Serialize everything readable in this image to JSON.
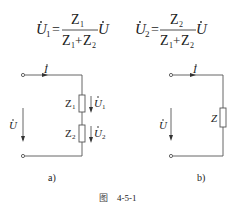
{
  "formulas": {
    "u1": {
      "lhs": "U",
      "lhs_sub": "1",
      "num": "Z",
      "num_sub": "1",
      "den_a": "Z",
      "den_a_sub": "1",
      "plus": "+",
      "den_b": "Z",
      "den_b_sub": "2",
      "rhs": "U",
      "eq": "="
    },
    "u2": {
      "lhs": "U",
      "lhs_sub": "2",
      "num": "Z",
      "num_sub": "2",
      "den_a": "Z",
      "den_a_sub": "1",
      "plus": "+",
      "den_b": "Z",
      "den_b_sub": "2",
      "rhs": "U",
      "eq": "="
    }
  },
  "circuit_a": {
    "current_label": "I",
    "voltage_label": "U",
    "z1_label": "Z",
    "z1_sub": "1",
    "z2_label": "Z",
    "z2_sub": "2",
    "u1_label": "U",
    "u1_sub": "1",
    "u2_label": "U",
    "u2_sub": "2",
    "caption": "a)"
  },
  "circuit_b": {
    "current_label": "I",
    "voltage_label": "U",
    "z_label": "Z",
    "caption": "b)"
  },
  "figure_caption": {
    "prefix": "图",
    "number": "4-5-1"
  }
}
